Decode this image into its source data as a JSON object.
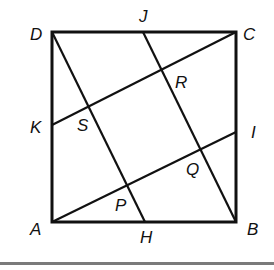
{
  "diagram": {
    "type": "geometry",
    "stroke_color": "#111111",
    "background": "#ffffff",
    "points": {
      "A": {
        "label": "A",
        "x": 52,
        "y": 222
      },
      "B": {
        "label": "B",
        "x": 236,
        "y": 222
      },
      "C": {
        "label": "C",
        "x": 236,
        "y": 32
      },
      "D": {
        "label": "D",
        "x": 52,
        "y": 32
      },
      "H": {
        "label": "H",
        "x": 145,
        "y": 222
      },
      "I": {
        "label": "I",
        "x": 236,
        "y": 132
      },
      "J": {
        "label": "J",
        "x": 143,
        "y": 32
      },
      "K": {
        "label": "K",
        "x": 52,
        "y": 125
      },
      "P": {
        "label": "P",
        "x": 127,
        "y": 185
      },
      "Q": {
        "label": "Q",
        "x": 200,
        "y": 149
      },
      "R": {
        "label": "R",
        "x": 162,
        "y": 70
      },
      "S": {
        "label": "S",
        "x": 89,
        "y": 107
      }
    },
    "segments": [
      {
        "from": "A",
        "to": "B"
      },
      {
        "from": "B",
        "to": "C"
      },
      {
        "from": "C",
        "to": "D"
      },
      {
        "from": "D",
        "to": "A"
      },
      {
        "from": "D",
        "to": "H"
      },
      {
        "from": "J",
        "to": "B"
      },
      {
        "from": "K",
        "to": "C"
      },
      {
        "from": "A",
        "to": "I"
      }
    ],
    "labels": {
      "A": "A",
      "B": "B",
      "C": "C",
      "D": "D",
      "H": "H",
      "I": "I",
      "J": "J",
      "K": "K",
      "P": "P",
      "Q": "Q",
      "R": "R",
      "S": "S"
    }
  }
}
